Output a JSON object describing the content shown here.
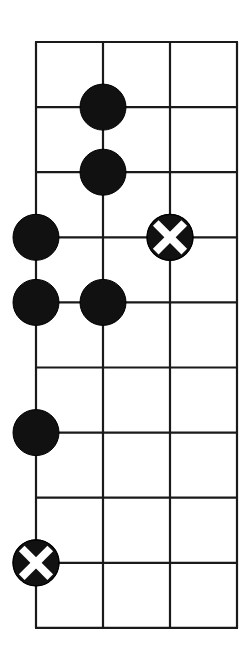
{
  "board": {
    "columns": 4,
    "rows": 10,
    "origin_x": 36,
    "origin_y": 42,
    "col_spacing": 67,
    "row_spacing": 65.1,
    "line_color": "#1a1a1a",
    "line_width": 2.2,
    "background": "#ffffff"
  },
  "stones": [
    {
      "type": "black",
      "col": 1,
      "row": 1
    },
    {
      "type": "black",
      "col": 1,
      "row": 2
    },
    {
      "type": "black",
      "col": 0,
      "row": 3
    },
    {
      "type": "marked",
      "col": 2,
      "row": 3
    },
    {
      "type": "black",
      "col": 0,
      "row": 4
    },
    {
      "type": "black",
      "col": 1,
      "row": 4
    },
    {
      "type": "black",
      "col": 0,
      "row": 6
    },
    {
      "type": "marked",
      "col": 0,
      "row": 8
    }
  ],
  "stone_style": {
    "radius": 23,
    "black_fill": "#111111",
    "mark_color": "#ffffff",
    "mark_icon": "x-mark-icon"
  }
}
